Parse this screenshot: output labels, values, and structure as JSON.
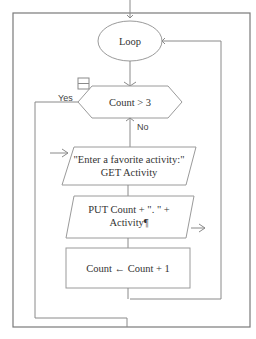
{
  "flowchart": {
    "loop_node": {
      "label": "Loop"
    },
    "decision": {
      "label": "Count > 3",
      "yes_label": "Yes",
      "no_label": "No",
      "collapse_icon": "minus-box-icon"
    },
    "input_node": {
      "line1": "\"Enter a favorite activity:\"",
      "line2": "GET Activity"
    },
    "output_node": {
      "line1": "PUT Count  +  \". \"  +",
      "line2": "Activity¶"
    },
    "process_node": {
      "label": "Count ← Count  +  1"
    },
    "colors": {
      "line": "#8a8a8a",
      "frame": "#7a7a7a",
      "text": "#333333",
      "background": "#ffffff"
    }
  }
}
